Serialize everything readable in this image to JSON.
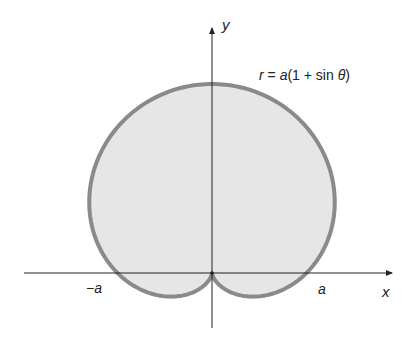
{
  "figure": {
    "equation": "r = a(1 + sin θ)",
    "equation_parts": {
      "r": "r",
      "eq": " = ",
      "a": "a",
      "rest": "(1 + sin ",
      "theta": "θ",
      "close": ")"
    },
    "x_axis_label": "x",
    "y_axis_label": "y",
    "neg_a_label": "−a",
    "pos_a_label": "a",
    "fill_color": "#e6e6e6",
    "stroke_color": "#8a8a8a",
    "axis_color": "#222222"
  },
  "chart_data": {
    "type": "polar curve (cardioid)",
    "equation": "r = a(1 + sin θ)",
    "xlabel": "x",
    "ylabel": "y",
    "annotations": [
      "−a",
      "a",
      "r = a(1 + sin θ)"
    ],
    "key_points": [
      {
        "label": "origin (cusp)",
        "x": 0,
        "y": 0
      },
      {
        "label": "x-intercept",
        "x": -1,
        "y": 0
      },
      {
        "label": "x-intercept",
        "x": 1,
        "y": 0
      },
      {
        "label": "top",
        "x": 0,
        "y": 2
      }
    ],
    "units": "multiples of a",
    "filled": true
  }
}
